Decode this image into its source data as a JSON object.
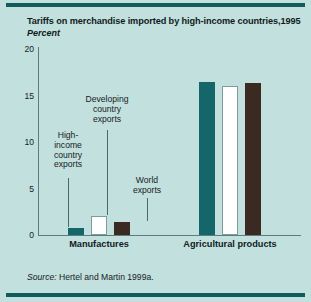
{
  "figure": {
    "title": "Tariffs on merchandise imported by high-income countries,1995",
    "subtitle": "Percent",
    "source_prefix": "Source:",
    "source_text": " Hertel and Martin 1999a.",
    "background_color": "#c2e0dd",
    "rule_color": "#115c5a"
  },
  "chart_data": {
    "type": "bar",
    "title": "Tariffs on merchandise imported by high-income countries,1995",
    "subtitle": "Percent",
    "xlabel": "",
    "ylabel": "Percent",
    "ylim": [
      0,
      20
    ],
    "yticks": [
      0,
      5,
      10,
      15,
      20
    ],
    "ytick_labels": [
      "0",
      "5",
      "10",
      "15",
      "20"
    ],
    "grid": false,
    "legend_position": "annotations",
    "categories": [
      "Manufactures",
      "Agricultural products"
    ],
    "series": [
      {
        "name": "High-income country exports",
        "color": "#14666a",
        "values": [
          0.8,
          16.5
        ]
      },
      {
        "name": "Developing country exports",
        "color": "#ffffff",
        "values": [
          2.0,
          16.0
        ]
      },
      {
        "name": "World exports",
        "color": "#3b2a22",
        "values": [
          1.4,
          16.3
        ]
      }
    ],
    "annotations": [
      {
        "text": "High-\nincome\ncountry\nexports",
        "series": "High-income country exports"
      },
      {
        "text": "Developing\ncountry\nexports",
        "series": "Developing country exports"
      },
      {
        "text": "World\nexports",
        "series": "World exports"
      }
    ]
  }
}
